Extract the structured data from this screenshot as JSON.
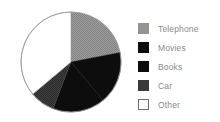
{
  "chart_data": {
    "type": "pie",
    "title": "",
    "subtitle": "",
    "xlabel": "",
    "ylabel": "",
    "grid": false,
    "legend_position": "right",
    "start_angle_deg": 0,
    "direction": "clockwise",
    "categories": [
      "Telephone",
      "Movies",
      "Books",
      "Car",
      "Other"
    ],
    "values": [
      22,
      17,
      17,
      8,
      36
    ],
    "units": "percent",
    "slices": [
      {
        "label": "Telephone",
        "value": 22,
        "start_deg": 0,
        "end_deg": 79,
        "color": "#949494",
        "fill": "dithered-gray"
      },
      {
        "label": "Movies",
        "value": 17,
        "start_deg": 79,
        "end_deg": 140,
        "color": "#0d0d0d",
        "fill": "solid-black"
      },
      {
        "label": "Books",
        "value": 17,
        "start_deg": 140,
        "end_deg": 201,
        "color": "#0d0d0d",
        "fill": "solid-black"
      },
      {
        "label": "Car",
        "value": 8,
        "start_deg": 201,
        "end_deg": 230,
        "color": "#3a3a3a",
        "fill": "dithered-dark-gray"
      },
      {
        "label": "Other",
        "value": 36,
        "start_deg": 230,
        "end_deg": 360,
        "color": "#ffffff",
        "fill": "white-outlined"
      }
    ],
    "geometry": {
      "center_x": 71,
      "center_y": 62,
      "radius": 50
    },
    "outline_color": "#9a9a9a"
  },
  "legend": {
    "items": [
      {
        "label": "Telephone",
        "swatch_color": "#949494",
        "swatch_border": "#949494"
      },
      {
        "label": "Movies",
        "swatch_color": "#0d0d0d",
        "swatch_border": "#0d0d0d"
      },
      {
        "label": "Books",
        "swatch_color": "#0d0d0d",
        "swatch_border": "#0d0d0d"
      },
      {
        "label": "Car",
        "swatch_color": "#3a3a3a",
        "swatch_border": "#3a3a3a"
      },
      {
        "label": "Other",
        "swatch_color": "#ffffff",
        "swatch_border": "#6e6e6e"
      }
    ]
  }
}
